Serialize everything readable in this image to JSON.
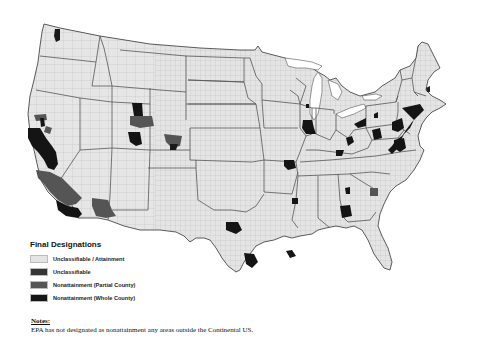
{
  "map": {
    "title": "Final Designations",
    "region": "Continental United States (county level)",
    "colors": {
      "attainment": "#e4e4e4",
      "unclassifiable": "#333333",
      "partial": "#555555",
      "whole": "#141414",
      "border": "#8a8a8a",
      "state_border": "#555555"
    },
    "nonattainment_areas": [
      {
        "name": "Seattle-Tacoma, WA",
        "type": "whole"
      },
      {
        "name": "San Francisco Bay Area, CA",
        "type": "whole"
      },
      {
        "name": "Sacramento, CA",
        "type": "whole"
      },
      {
        "name": "Chico, CA",
        "type": "partial"
      },
      {
        "name": "San Joaquin Valley, CA",
        "type": "partial"
      },
      {
        "name": "South Coast (Los Angeles), CA",
        "type": "whole"
      },
      {
        "name": "Imperial County, CA",
        "type": "partial"
      },
      {
        "name": "Phoenix, AZ",
        "type": "partial"
      },
      {
        "name": "Salt Lake City, UT",
        "type": "whole"
      },
      {
        "name": "Northern Wasatch, UT",
        "type": "partial"
      },
      {
        "name": "Denver-Front Range, CO",
        "type": "partial"
      },
      {
        "name": "Dallas-Fort Worth, TX",
        "type": "whole"
      },
      {
        "name": "Houston-Galveston, TX",
        "type": "whole"
      },
      {
        "name": "Baton Rouge, LA",
        "type": "whole"
      },
      {
        "name": "St. Louis, MO-IL",
        "type": "whole"
      },
      {
        "name": "Memphis, TN",
        "type": "whole"
      },
      {
        "name": "Chicago, IL-IN",
        "type": "whole"
      },
      {
        "name": "Sheboygan, WI",
        "type": "whole"
      },
      {
        "name": "Cincinnati, OH",
        "type": "whole"
      },
      {
        "name": "Columbus, OH",
        "type": "whole"
      },
      {
        "name": "Cleveland, OH",
        "type": "whole"
      },
      {
        "name": "Pittsburgh, PA",
        "type": "whole"
      },
      {
        "name": "Philadelphia-NYC Corridor",
        "type": "whole"
      },
      {
        "name": "Washington DC-Baltimore",
        "type": "whole"
      },
      {
        "name": "Knoxville, TN",
        "type": "whole"
      },
      {
        "name": "Charlotte, NC",
        "type": "partial"
      },
      {
        "name": "Atlanta, GA",
        "type": "whole"
      }
    ]
  },
  "legend": {
    "title": "Final Designations",
    "items": [
      {
        "label": "Unclassifiable / Attainment",
        "color": "#e4e4e4"
      },
      {
        "label": "Unclassifiable",
        "color": "#353535"
      },
      {
        "label": "Nonattainment (Partial County)",
        "color": "#555555"
      },
      {
        "label": "Nonattainment (Whole County)",
        "color": "#161616"
      }
    ]
  },
  "notes": {
    "title": "Notes:",
    "text": "EPA has not designated as nonattainment any areas outside the Continental US."
  }
}
